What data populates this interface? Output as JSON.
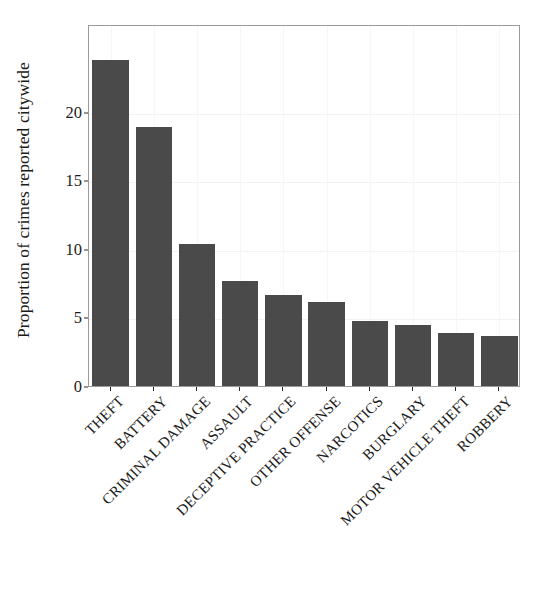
{
  "chart_data": {
    "type": "bar",
    "title": "",
    "subtitle": "",
    "xlabel": "",
    "ylabel": "Proportion of crimes reported citywide",
    "categories": [
      "THEFT",
      "BATTERY",
      "CRIMINAL DAMAGE",
      "ASSAULT",
      "DECEPTIVE PRACTICE",
      "OTHER OFFENSE",
      "NARCOTICS",
      "BURGLARY",
      "MOTOR VEHICLE THEFT",
      "ROBBERY"
    ],
    "values": [
      23.9,
      19.0,
      10.5,
      7.8,
      6.8,
      6.3,
      4.85,
      4.6,
      4.0,
      3.8
    ],
    "ylim": [
      0,
      26.4
    ],
    "xlim": [
      0,
      10
    ],
    "yticks": [
      0,
      5,
      10,
      15,
      20
    ],
    "ytick_labels": [
      "0",
      "5",
      "10",
      "15",
      "20"
    ],
    "grid": true,
    "grid_axis": "both",
    "legend": false,
    "legend_position": "none",
    "bar_color": "#4a4a4a",
    "axis_color": "#9a9a9a",
    "grid_color": "#f2f2f2",
    "text_color": "#1b1b1b",
    "background_color": "#ffffff",
    "bar_width_fraction": 0.84,
    "xtick_label_rotation": -45
  }
}
